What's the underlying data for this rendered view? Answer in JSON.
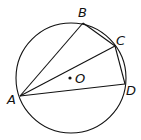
{
  "diagram": {
    "type": "inscribed-quadrilateral-in-circle",
    "circle": {
      "center_label": "O",
      "cx": 71,
      "cy": 78,
      "r": 55
    },
    "points": [
      {
        "label": "A",
        "x": 20,
        "y": 96,
        "lx": 7,
        "ly": 104
      },
      {
        "label": "B",
        "x": 83,
        "y": 23,
        "lx": 78,
        "ly": 17
      },
      {
        "label": "C",
        "x": 115,
        "y": 46,
        "lx": 116,
        "ly": 45
      },
      {
        "label": "D",
        "x": 125,
        "y": 84,
        "lx": 126,
        "ly": 95
      }
    ],
    "center_point": {
      "label": "O",
      "x": 70,
      "y": 78,
      "lx": 76,
      "ly": 83
    },
    "segments": [
      "AB",
      "BC",
      "CD",
      "DA",
      "AC"
    ],
    "stroke_color": "#111111"
  }
}
